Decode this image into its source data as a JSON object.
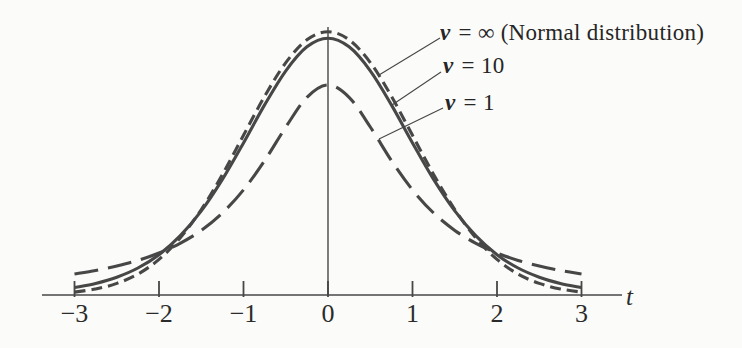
{
  "figure": {
    "background": "#fbfbf9",
    "ink": "#474747",
    "text_color": "#262626"
  },
  "chart_data": {
    "type": "line",
    "title": "",
    "xlabel": "t",
    "ylabel": "",
    "grid": false,
    "legend_position": "upper-right-with-leader-lines",
    "xlim": [
      -3.4,
      3.5
    ],
    "ylim": [
      0,
      0.42
    ],
    "x_ticks": [
      -3,
      -2,
      -1,
      0,
      1,
      2,
      3
    ],
    "x_tick_labels": [
      "−3",
      "−2",
      "−1",
      "0",
      "1",
      "2",
      "3"
    ],
    "x": [
      -3,
      -2.75,
      -2.5,
      -2.25,
      -2,
      -1.75,
      -1.5,
      -1.25,
      -1,
      -0.75,
      -0.5,
      -0.25,
      0,
      0.25,
      0.5,
      0.75,
      1,
      1.25,
      1.5,
      1.75,
      2,
      2.25,
      2.5,
      2.75,
      3
    ],
    "series": [
      {
        "name": "nu-infinity",
        "label": "ν = ∞ (Normal distribution)",
        "label_prefix": "ν",
        "label_suffix": " = ∞ (Normal distribution)",
        "degrees_of_freedom": "∞",
        "line_style": "short-dash",
        "peak_density": 0.3989,
        "values": [
          0.0044,
          0.0091,
          0.0175,
          0.0317,
          0.054,
          0.0863,
          0.1295,
          0.1826,
          0.242,
          0.3011,
          0.3521,
          0.3867,
          0.3989,
          0.3867,
          0.3521,
          0.3011,
          0.242,
          0.1826,
          0.1295,
          0.0863,
          0.054,
          0.0317,
          0.0175,
          0.0091,
          0.0044
        ]
      },
      {
        "name": "nu-10",
        "label": "ν = 10",
        "label_prefix": "ν",
        "label_suffix": " = 10",
        "degrees_of_freedom": 10,
        "line_style": "solid",
        "peak_density": 0.3891,
        "values": [
          0.0114,
          0.0176,
          0.0269,
          0.0409,
          0.0611,
          0.0895,
          0.1274,
          0.1751,
          0.2304,
          0.288,
          0.3397,
          0.376,
          0.3891,
          0.376,
          0.3397,
          0.288,
          0.2304,
          0.1751,
          0.1274,
          0.0895,
          0.0611,
          0.0409,
          0.0269,
          0.0176,
          0.0114
        ]
      },
      {
        "name": "nu-1",
        "label": "ν = 1",
        "label_prefix": "ν",
        "label_suffix": " = 1",
        "degrees_of_freedom": 1,
        "line_style": "long-dash",
        "peak_density": 0.3183,
        "values": [
          0.0318,
          0.0372,
          0.0439,
          0.0525,
          0.0637,
          0.0784,
          0.0979,
          0.1242,
          0.1592,
          0.2037,
          0.2546,
          0.2996,
          0.3183,
          0.2996,
          0.2546,
          0.2037,
          0.1592,
          0.1242,
          0.0979,
          0.0784,
          0.0637,
          0.0525,
          0.0439,
          0.0372,
          0.0318
        ]
      }
    ],
    "plot": {
      "x0_px": 328,
      "px_per_unit": 84.5,
      "axis_y_px": 295,
      "px_per_density": 660,
      "axis_x1": 42,
      "axis_x2": 622,
      "tick_y1": 281,
      "tick_y2": 297,
      "vaxis_top": 27,
      "curve_width": 3.1,
      "axis_width": 1.7,
      "tick_width": 1.8,
      "leader_width": 1.1,
      "dash_patterns": {
        "short-dash": "11 6",
        "solid": "",
        "long-dash": "24 10"
      }
    },
    "leader_lines": [
      {
        "x1": 440,
        "y1": 38,
        "x2": 379,
        "y2": 75
      },
      {
        "x1": 441,
        "y1": 72,
        "x2": 392,
        "y2": 105
      },
      {
        "x1": 443,
        "y1": 108,
        "x2": 379,
        "y2": 139
      }
    ]
  }
}
